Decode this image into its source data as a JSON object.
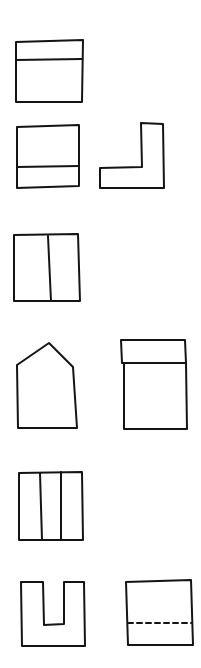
{
  "diagram": {
    "title": "",
    "stroke_color": "#141414",
    "background_color": "#ffffff",
    "shapes": [
      {
        "name": "box-with-top-band",
        "type": "rectangle-horizontal-divider",
        "divider_position": "upper"
      },
      {
        "name": "box-with-bottom-band",
        "type": "rectangle-horizontal-divider",
        "divider_position": "lower"
      },
      {
        "name": "l-shape",
        "type": "l-shape"
      },
      {
        "name": "box-split-two-columns",
        "type": "rectangle-vertical-divider",
        "columns": 2
      },
      {
        "name": "house-pentagon",
        "type": "pentagon"
      },
      {
        "name": "tall-box-with-lid",
        "type": "rectangle-with-top-band"
      },
      {
        "name": "box-split-three-columns",
        "type": "rectangle-vertical-divider",
        "columns": 3
      },
      {
        "name": "u-shape",
        "type": "u-shape"
      },
      {
        "name": "box-with-dashed-line",
        "type": "rectangle-dashed-divider",
        "line_style": "dashed"
      }
    ]
  }
}
